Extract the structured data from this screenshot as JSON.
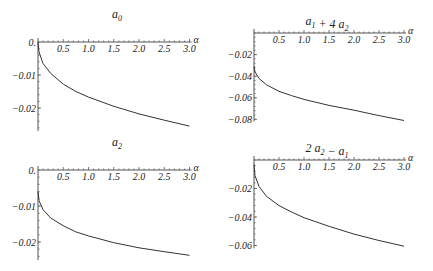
{
  "chart_data": [
    {
      "type": "line",
      "title": "a0",
      "title_main": "a",
      "title_sub": "0",
      "xlabel": "α",
      "ylabel": "",
      "xlim": [
        0,
        3.0
      ],
      "ylim": [
        -0.027,
        0.0
      ],
      "x_ticks": [
        "0.5",
        "1.0",
        "1.5",
        "2.0",
        "2.5",
        "3.0"
      ],
      "y_ticks": [
        "0.",
        "-0.01",
        "-0.02"
      ],
      "y_tick_values": [
        0.0,
        -0.01,
        -0.02
      ],
      "x": [
        0.0,
        0.02,
        0.1,
        0.25,
        0.5,
        0.75,
        1.0,
        1.5,
        2.0,
        2.5,
        3.0
      ],
      "values": [
        0.0,
        -0.003,
        -0.0065,
        -0.0095,
        -0.0128,
        -0.015,
        -0.0167,
        -0.0195,
        -0.0218,
        -0.0237,
        -0.0255
      ],
      "grid": false,
      "panel": {
        "left": 0,
        "top": 0,
        "origin_x": 38,
        "axis_y": 42,
        "px_per_x": 50.5,
        "px_per_y": 3300
      }
    },
    {
      "type": "line",
      "title": "a1 + 4 a2",
      "title_parts": [
        {
          "t": "a",
          "sub": "1"
        },
        {
          "t": " + 4 "
        },
        {
          "t": "a",
          "sub": "2"
        }
      ],
      "xlabel": "α",
      "ylabel": "",
      "xlim": [
        0,
        3.0
      ],
      "ylim": [
        -0.082,
        0.0
      ],
      "x_ticks": [
        "0.5",
        "1.0",
        "1.5",
        "2.0",
        "2.5",
        "3.0"
      ],
      "y_ticks": [
        "-0.02",
        "-0.04",
        "-0.06",
        "-0.08"
      ],
      "y_tick_values": [
        -0.02,
        -0.04,
        -0.06,
        -0.08
      ],
      "x": [
        0.0,
        0.02,
        0.1,
        0.25,
        0.5,
        0.75,
        1.0,
        1.5,
        2.0,
        2.5,
        3.0
      ],
      "values": [
        -0.031,
        -0.036,
        -0.042,
        -0.048,
        -0.054,
        -0.058,
        -0.0615,
        -0.067,
        -0.0715,
        -0.0765,
        -0.081
      ],
      "grid": false,
      "panel": {
        "left": 216,
        "top": 0,
        "origin_x": 38,
        "axis_y": 33,
        "px_per_x": 50.0,
        "px_per_y": 1080
      }
    },
    {
      "type": "line",
      "title": "a2",
      "title_main": "a",
      "title_sub": "2",
      "xlabel": "α",
      "ylabel": "",
      "xlim": [
        0,
        3.0
      ],
      "ylim": [
        -0.025,
        0.0
      ],
      "x_ticks": [
        "0.5",
        "1.0",
        "1.5",
        "2.0",
        "2.5",
        "3.0"
      ],
      "y_ticks": [
        "0.",
        "-0.01",
        "-0.02"
      ],
      "y_tick_values": [
        0.0,
        -0.01,
        -0.02
      ],
      "x": [
        0.0,
        0.02,
        0.1,
        0.25,
        0.5,
        0.75,
        1.0,
        1.5,
        2.0,
        2.5,
        3.0
      ],
      "values": [
        -0.006,
        -0.0085,
        -0.011,
        -0.0133,
        -0.0155,
        -0.0172,
        -0.0183,
        -0.0202,
        -0.0216,
        -0.0227,
        -0.0237
      ],
      "grid": false,
      "panel": {
        "left": 0,
        "top": 128,
        "origin_x": 38,
        "axis_y": 42,
        "px_per_x": 50.5,
        "px_per_y": 3600
      }
    },
    {
      "type": "line",
      "title": "2 a2 − a1",
      "title_parts": [
        {
          "t": "2 "
        },
        {
          "t": "a",
          "sub": "2"
        },
        {
          "t": " − "
        },
        {
          "t": "a",
          "sub": "1"
        }
      ],
      "xlabel": "α",
      "ylabel": "",
      "xlim": [
        0,
        3.0
      ],
      "ylim": [
        -0.062,
        0.0
      ],
      "x_ticks": [
        "0.5",
        "1.0",
        "1.5",
        "2.0",
        "2.5",
        "3.0"
      ],
      "y_ticks": [
        "-0.02",
        "-0.04",
        "-0.06"
      ],
      "y_tick_values": [
        -0.02,
        -0.04,
        -0.06
      ],
      "x": [
        0.0,
        0.02,
        0.1,
        0.25,
        0.5,
        0.75,
        1.0,
        1.5,
        2.0,
        2.5,
        3.0
      ],
      "values": [
        -0.003,
        -0.011,
        -0.0185,
        -0.0255,
        -0.032,
        -0.0365,
        -0.0405,
        -0.0465,
        -0.052,
        -0.0565,
        -0.0605
      ],
      "grid": false,
      "panel": {
        "left": 216,
        "top": 128,
        "origin_x": 38,
        "axis_y": 32,
        "px_per_x": 50.0,
        "px_per_y": 1425
      }
    }
  ],
  "axis_label": "α"
}
